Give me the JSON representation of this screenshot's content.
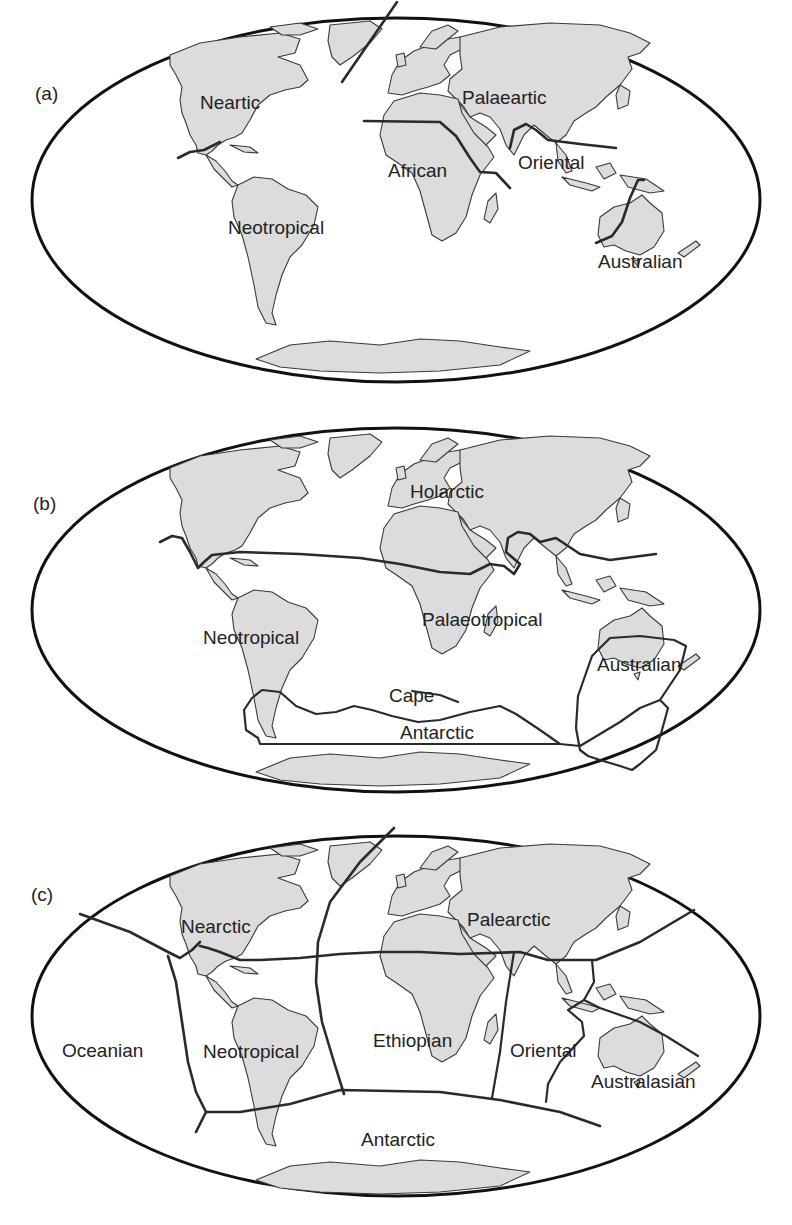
{
  "figure": {
    "colors": {
      "land": "#dcdcdc",
      "coastline": "#3a3a3a",
      "boundary": "#2a2a2a",
      "background": "#ffffff"
    },
    "panels": [
      {
        "id": "a",
        "label": "(a)",
        "regions": [
          "Neartic",
          "Palaeartic",
          "African",
          "Oriental",
          "Neotropical",
          "Australian"
        ]
      },
      {
        "id": "b",
        "label": "(b)",
        "regions": [
          "Holarctic",
          "Neotropical",
          "Palaeotropical",
          "Australian",
          "Cape",
          "Antarctic"
        ]
      },
      {
        "id": "c",
        "label": "(c)",
        "regions": [
          "Nearctic",
          "Palearctic",
          "Oceanian",
          "Neotropical",
          "Ethiopian",
          "Oriental",
          "Australasian",
          "Antarctic"
        ]
      }
    ]
  },
  "panel_a": {
    "label": "(a)",
    "neartic": "Neartic",
    "palaeartic": "Palaeartic",
    "african": "African",
    "oriental": "Oriental",
    "neotropical": "Neotropical",
    "australian": "Australian"
  },
  "panel_b": {
    "label": "(b)",
    "holarctic": "Holarctic",
    "neotropical": "Neotropical",
    "palaeotropical": "Palaeotropical",
    "australian": "Australian",
    "cape": "Cape",
    "antarctic": "Antarctic"
  },
  "panel_c": {
    "label": "(c)",
    "nearctic": "Nearctic",
    "palearctic": "Palearctic",
    "oceanian": "Oceanian",
    "neotropical": "Neotropical",
    "ethiopian": "Ethiopian",
    "oriental": "Oriental",
    "australasian": "Australasian",
    "antarctic": "Antarctic"
  }
}
